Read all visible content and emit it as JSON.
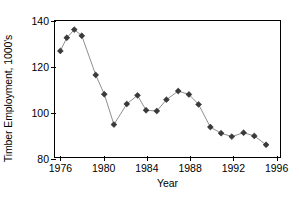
{
  "chart_data": {
    "type": "line",
    "title": "",
    "xlabel": "Year",
    "ylabel": "Timber Employment, 1000's",
    "xlim": [
      1975.5,
      1996.5
    ],
    "ylim": [
      80,
      140
    ],
    "xticks": [
      1976,
      1980,
      1984,
      1988,
      1992,
      1996
    ],
    "xtick_labels": [
      "1976",
      "1980",
      "1984",
      "1988",
      "1992",
      "1996"
    ],
    "yticks": [
      80,
      100,
      120,
      140
    ],
    "ytick_labels": [
      "80",
      "100",
      "120",
      "140"
    ],
    "grid": false,
    "legend": null,
    "marker": "diamond",
    "line_color": "#808080",
    "marker_color": "#3a3a3a",
    "x": [
      1976,
      1976.5,
      1977,
      1977.5,
      1978,
      1979,
      1980,
      1981,
      1982,
      1983,
      1984,
      1984.5,
      1985,
      1986,
      1987,
      1988,
      1988.5,
      1989,
      1990,
      1991,
      1992,
      1993,
      1994,
      1995,
      1996
    ],
    "values": [
      126.8,
      132.6,
      136.2,
      133.5,
      133.5,
      116.2,
      116.2,
      107.7,
      94.3,
      103.4,
      107.2,
      107.2,
      100.6,
      100.3,
      105.3,
      109.1,
      109.1,
      107.6,
      103.2,
      93.2,
      90.5,
      89.0,
      90.7,
      89.3,
      85.4
    ],
    "series": [
      {
        "name": "Timber Employment",
        "points": [
          {
            "x": 1976.0,
            "y": 126.8
          },
          {
            "x": 1976.6,
            "y": 132.6
          },
          {
            "x": 1977.3,
            "y": 136.2
          },
          {
            "x": 1978.0,
            "y": 133.5
          },
          {
            "x": 1979.3,
            "y": 116.2
          },
          {
            "x": 1980.1,
            "y": 107.7
          },
          {
            "x": 1981.0,
            "y": 94.3
          },
          {
            "x": 1982.2,
            "y": 103.4
          },
          {
            "x": 1983.2,
            "y": 107.2
          },
          {
            "x": 1984.0,
            "y": 100.6
          },
          {
            "x": 1985.0,
            "y": 100.3
          },
          {
            "x": 1985.9,
            "y": 105.3
          },
          {
            "x": 1987.0,
            "y": 109.1
          },
          {
            "x": 1988.0,
            "y": 107.6
          },
          {
            "x": 1988.9,
            "y": 103.2
          },
          {
            "x": 1990.0,
            "y": 93.2
          },
          {
            "x": 1991.0,
            "y": 90.5
          },
          {
            "x": 1992.0,
            "y": 89.0
          },
          {
            "x": 1993.1,
            "y": 90.7
          },
          {
            "x": 1994.1,
            "y": 89.3
          },
          {
            "x": 1995.2,
            "y": 85.4
          }
        ]
      }
    ]
  }
}
